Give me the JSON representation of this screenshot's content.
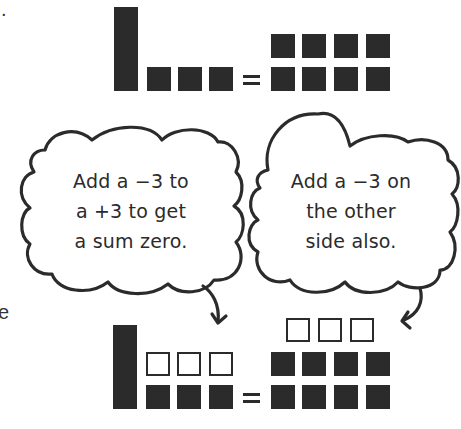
{
  "fragments": {
    "top_left_period": ".",
    "mid_left_letter": "e"
  },
  "top_equation": {
    "left": {
      "long_bars": 1,
      "positive_units_filled": 3
    },
    "equals": "=",
    "right": {
      "positive_units_filled": 8,
      "layout": "2 rows x 4"
    }
  },
  "bubbles": [
    {
      "id": "left",
      "lines": [
        "Add a −3 to",
        "a +3 to get",
        "a sum zero."
      ]
    },
    {
      "id": "right",
      "lines": [
        "Add a −3 on",
        "the other",
        "side also."
      ]
    }
  ],
  "bottom_equation": {
    "left": {
      "long_bars": 1,
      "negative_units_outline": 3,
      "positive_units_filled": 3
    },
    "equals": "=",
    "right": {
      "negative_units_outline": 3,
      "positive_units_filled": 8,
      "layout": "2 rows x 4"
    }
  },
  "colors": {
    "ink": "#2b2b2b",
    "background": "#ffffff"
  }
}
